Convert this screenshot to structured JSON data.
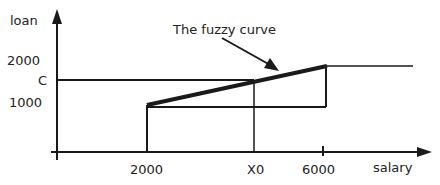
{
  "diagram": {
    "title_annotation": "The fuzzy curve",
    "y_axis": {
      "label": "loan",
      "ticks": [
        "2000",
        "C",
        "1000"
      ]
    },
    "x_axis": {
      "label": "salary",
      "ticks": [
        "2000",
        "X0",
        "6000"
      ]
    },
    "colors": {
      "line": "#1a1a1a",
      "text": "#222222",
      "background": "#ffffff"
    }
  }
}
